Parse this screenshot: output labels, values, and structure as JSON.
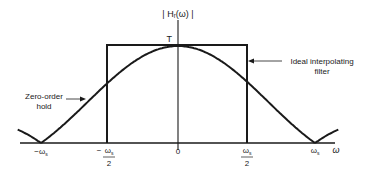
{
  "figure": {
    "y_axis_label": "| Hᵣ(ω) |",
    "peak_label": "T",
    "x_axis_label": "ω",
    "ticks": [
      {
        "label": "−ωs",
        "value": -1.0
      },
      {
        "label": "−ωs/2",
        "value": -0.5
      },
      {
        "label": "0",
        "value": 0
      },
      {
        "label": "ωs/2",
        "value": 0.5
      },
      {
        "label": "ωs",
        "value": 1.0
      }
    ],
    "annotations": [
      {
        "id": "zoh",
        "lines": [
          "Zero-order",
          "hold"
        ]
      },
      {
        "id": "ideal",
        "lines": [
          "Ideal interpolating",
          "filter"
        ]
      }
    ],
    "colors": {
      "line": "#1a1a1a",
      "background": "#ffffff"
    }
  },
  "chart_data": {
    "type": "line",
    "title": "",
    "xlabel": "ω",
    "ylabel": "|Hᵣ(ω)|",
    "x_unit": "ωs",
    "series": [
      {
        "name": "Zero-order hold",
        "formula": "T*|sin(πω/ωs)/(πω/ωs)|",
        "x": [
          -1.17,
          -1.0,
          -0.75,
          -0.5,
          -0.25,
          0,
          0.25,
          0.5,
          0.75,
          1.0,
          1.17
        ],
        "values": [
          0.13,
          0,
          0.3,
          0.64,
          0.9,
          1.0,
          0.9,
          0.64,
          0.3,
          0,
          0.13
        ]
      },
      {
        "name": "Ideal interpolating filter",
        "x": [
          -0.5,
          -0.5,
          0.5,
          0.5
        ],
        "values": [
          0,
          1.0,
          1.0,
          0
        ]
      }
    ],
    "peak_value_label": "T",
    "xlim": [
      -1.17,
      1.17
    ],
    "ylim": [
      0,
      1.0
    ],
    "grid": false,
    "legend": "none (callout annotations)"
  }
}
